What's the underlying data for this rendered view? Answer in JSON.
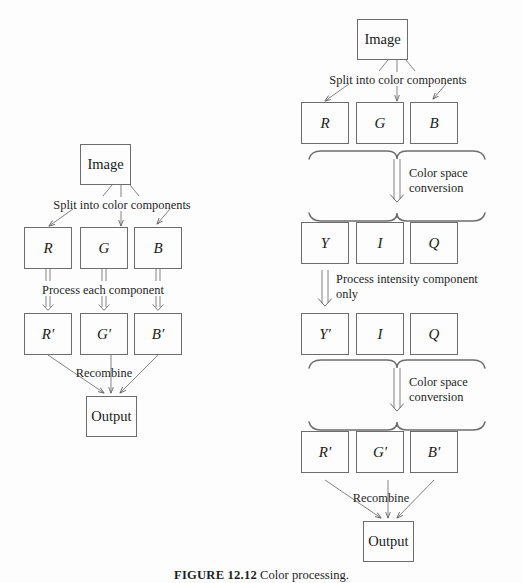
{
  "figure": {
    "caption_label": "FIGURE 12.12",
    "caption_text": "Color processing.",
    "stroke_color": "#6d6d6d",
    "text_color": "#1f1f1f",
    "background_color": "#fdfdfd"
  },
  "left_diagram": {
    "name": "rgb-direct-processing",
    "image_box": "Image",
    "split_label": "Split into color components",
    "components": [
      "R",
      "G",
      "B"
    ],
    "process_label": "Process each component",
    "processed_components": [
      "R′",
      "G′",
      "B′"
    ],
    "recombine_label": "Recombine",
    "output_box": "Output"
  },
  "right_diagram": {
    "name": "yiq-intensity-processing",
    "image_box": "Image",
    "split_label": "Split into color components",
    "components": [
      "R",
      "G",
      "B"
    ],
    "conversion_label_line1": "Color space",
    "conversion_label_line2": "conversion",
    "yiq_components": [
      "Y",
      "I",
      "Q"
    ],
    "intensity_label_line1": "Process intensity component",
    "intensity_label_line2": "only",
    "yiq_processed": [
      "Y′",
      "I",
      "Q"
    ],
    "conversion_label2_line1": "Color space",
    "conversion_label2_line2": "conversion",
    "rgb_processed": [
      "R′",
      "G′",
      "B′"
    ],
    "recombine_label": "Recombine",
    "output_box": "Output"
  }
}
